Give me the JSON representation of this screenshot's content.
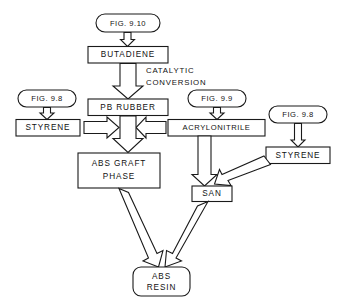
{
  "diagram": {
    "nodes": {
      "fig_910": {
        "label": "FIG. 9.10",
        "shape": "rounded"
      },
      "butadiene": {
        "label": "BUTADIENE",
        "shape": "rect"
      },
      "pb_rubber": {
        "label": "PB RUBBER",
        "shape": "rect"
      },
      "fig_98_left": {
        "label": "FIG. 9.8",
        "shape": "rounded"
      },
      "styrene_left": {
        "label": "STYRENE",
        "shape": "rect"
      },
      "fig_99": {
        "label": "FIG. 9.9",
        "shape": "rounded"
      },
      "acrylonitrile": {
        "label": "ACRYLONITRILE",
        "shape": "rect"
      },
      "fig_98_right": {
        "label": "FIG. 9.8",
        "shape": "rounded"
      },
      "styrene_right": {
        "label": "STYRENE",
        "shape": "rect"
      },
      "abs_graft_phase": {
        "label_line1": "ABS  GRAFT",
        "label_line2": "PHASE",
        "shape": "rect"
      },
      "san": {
        "label": "SAN",
        "shape": "rect"
      },
      "abs_resin": {
        "label_line1": "ABS",
        "label_line2": "RESIN",
        "shape": "rounded"
      }
    },
    "edge_labels": {
      "catalytic_line1": "CATALYTIC",
      "catalytic_line2": "CONVERSION"
    },
    "colors": {
      "stroke": "#1a1a1a",
      "fill": "#ffffff",
      "text": "#111111",
      "background": "#ffffff"
    }
  }
}
